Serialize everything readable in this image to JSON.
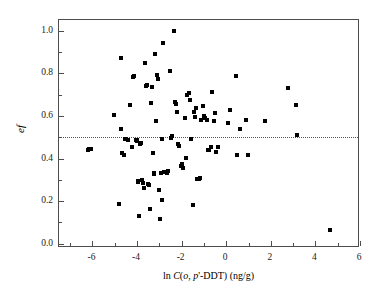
{
  "chart_data": {
    "type": "scatter",
    "title": "",
    "xlabel": "ln C(o, p'-DDT) (ng/g)",
    "ylabel": "ef",
    "xlim": [
      -7.5,
      6.0
    ],
    "ylim": [
      -0.02,
      1.05
    ],
    "xticks": [
      -6,
      -4,
      -2,
      0,
      2,
      4,
      6
    ],
    "xtick_labels": [
      "-6",
      "-4",
      "-2",
      "0",
      "2",
      "4",
      "6"
    ],
    "xminor_step": 1,
    "yticks": [
      0.0,
      0.2,
      0.4,
      0.6,
      0.8,
      1.0
    ],
    "ytick_labels": [
      "0.0",
      "0.2",
      "0.4",
      "0.6",
      "0.8",
      "1.0"
    ],
    "yminor_step": 0.1,
    "grid": false,
    "legend": "none",
    "marker": "square",
    "marker_color": "#000000",
    "marker_size_px": 4,
    "frame_color": "#4d4d4d",
    "annotations": [
      {
        "type": "hline",
        "y": 0.5,
        "style": "dotted",
        "color": "#555555",
        "label": "racemic ef = 0.5"
      }
    ],
    "x": [
      -6.22,
      -6.14,
      -6.06,
      -5.02,
      -4.8,
      -4.72,
      -4.7,
      -4.66,
      -4.58,
      -4.52,
      -4.48,
      -4.4,
      -4.32,
      -4.22,
      -4.18,
      -4.12,
      -4.06,
      -4.02,
      -3.98,
      -3.96,
      -3.94,
      -3.9,
      -3.86,
      -3.82,
      -3.78,
      -3.74,
      -3.7,
      -3.66,
      -3.6,
      -3.56,
      -3.5,
      -3.46,
      -3.42,
      -3.38,
      -3.34,
      -3.3,
      -3.26,
      -3.22,
      -3.18,
      -3.14,
      -3.1,
      -3.06,
      -3.02,
      -2.98,
      -2.94,
      -2.9,
      -2.86,
      -2.82,
      -2.78,
      -2.72,
      -2.66,
      -2.6,
      -2.54,
      -2.48,
      -2.42,
      -2.36,
      -2.3,
      -2.26,
      -2.22,
      -2.16,
      -2.1,
      -2.04,
      -1.98,
      -1.92,
      -1.86,
      -1.8,
      -1.74,
      -1.68,
      -1.62,
      -1.56,
      -1.5,
      -1.46,
      -1.42,
      -1.36,
      -1.3,
      -1.24,
      -1.18,
      -1.12,
      -1.06,
      -1.0,
      -0.94,
      -0.88,
      -0.82,
      -0.76,
      -0.7,
      -0.62,
      -0.56,
      -0.5,
      -0.44,
      -0.38,
      0.1,
      0.18,
      0.44,
      0.5,
      0.62,
      0.88,
      0.96,
      1.74,
      2.78,
      3.14,
      3.18,
      4.66
    ],
    "y": [
      0.44,
      0.443,
      0.445,
      0.605,
      0.188,
      0.87,
      0.54,
      0.424,
      0.418,
      0.492,
      0.491,
      0.489,
      0.65,
      0.452,
      0.782,
      0.786,
      0.489,
      0.487,
      0.484,
      0.295,
      0.291,
      0.128,
      0.47,
      0.473,
      0.3,
      0.287,
      0.261,
      0.846,
      0.74,
      0.744,
      0.281,
      0.277,
      0.165,
      0.66,
      0.736,
      0.424,
      0.33,
      0.326,
      0.89,
      0.578,
      0.794,
      0.775,
      0.252,
      0.118,
      0.332,
      0.49,
      0.204,
      0.94,
      0.335,
      0.336,
      0.33,
      0.343,
      0.812,
      0.498,
      0.504,
      1.0,
      0.664,
      0.655,
      0.62,
      0.47,
      0.461,
      0.365,
      0.372,
      0.355,
      0.588,
      0.404,
      0.7,
      0.707,
      0.676,
      0.49,
      0.184,
      0.62,
      0.596,
      0.635,
      0.306,
      0.303,
      0.308,
      0.58,
      0.645,
      0.6,
      0.588,
      0.583,
      0.442,
      0.438,
      0.455,
      0.71,
      0.578,
      0.612,
      0.43,
      0.455,
      0.568,
      0.628,
      0.787,
      0.418,
      0.54,
      0.58,
      0.415,
      0.578,
      0.73,
      0.65,
      0.512,
      0.066
    ]
  }
}
